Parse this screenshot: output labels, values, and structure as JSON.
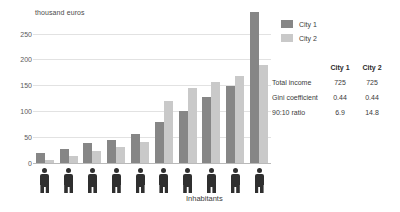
{
  "chart_data": {
    "type": "bar",
    "title": "",
    "ylabel": "thousand euros",
    "xlabel": "Inhabitants",
    "ylim": [
      0,
      250
    ],
    "yticks": [
      0,
      50,
      100,
      150,
      200,
      250
    ],
    "grid": true,
    "legend_position": "top-right",
    "categories": [
      "1",
      "2",
      "3",
      "4",
      "5",
      "6",
      "7",
      "8",
      "9",
      "10"
    ],
    "series": [
      {
        "name": "City 1",
        "color": "#868686",
        "values": [
          15,
          22,
          30,
          36,
          44,
          63,
          80,
          101,
          118,
          232
        ]
      },
      {
        "name": "City 2",
        "color": "#c9c9c9",
        "values": [
          4,
          10,
          18,
          25,
          32,
          95,
          115,
          125,
          133,
          150
        ]
      }
    ]
  },
  "axis": {
    "ylabel": "thousand euros",
    "xlabel": "Inhabitants",
    "ticks": [
      "250",
      "200",
      "150",
      "100",
      "50",
      "0"
    ]
  },
  "legend": {
    "items": [
      {
        "label": "City 1",
        "color": "#868686"
      },
      {
        "label": "City 2",
        "color": "#c9c9c9"
      }
    ]
  },
  "table": {
    "columns": [
      "",
      "City 1",
      "City 2"
    ],
    "col1_header": "City 1",
    "col2_header": "City 2",
    "rows": [
      {
        "label": "Total income",
        "city1": "725",
        "city2": "725"
      },
      {
        "label": "Gini coefficient",
        "city1": "0.44",
        "city2": "0.44"
      },
      {
        "label": "90:10 ratio",
        "city1": "6.9",
        "city2": "14.8"
      }
    ]
  }
}
